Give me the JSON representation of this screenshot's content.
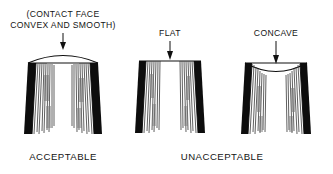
{
  "figure": {
    "kind": "technical-illustration",
    "background_color": "#ffffff",
    "ink_color": "#101010"
  },
  "annotations": {
    "convex_label_line1": "(CONTACT FACE",
    "convex_label_line2": "CONVEX AND SMOOTH)",
    "flat_label": "FLAT",
    "concave_label": "CONCAVE"
  },
  "captions": {
    "acceptable": "ACCEPTABLE",
    "unacceptable": "UNACCEPTABLE"
  },
  "figures": [
    {
      "id": "figure-convex",
      "profile": "convex",
      "verdict": "ACCEPTABLE",
      "callout": "(CONTACT FACE CONVEX AND SMOOTH)"
    },
    {
      "id": "figure-flat",
      "profile": "flat",
      "verdict": "UNACCEPTABLE",
      "callout": "FLAT"
    },
    {
      "id": "figure-concave",
      "profile": "concave",
      "verdict": "UNACCEPTABLE",
      "callout": "CONCAVE"
    }
  ]
}
